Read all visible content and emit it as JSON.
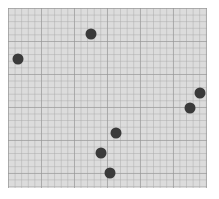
{
  "chart_data": {
    "type": "scatter",
    "title": "",
    "xlabel": "",
    "ylabel": "",
    "grid": true,
    "legend": null,
    "plot_area_px": {
      "left": 8,
      "top": 8,
      "width": 199,
      "height": 180
    },
    "point_color": "#3a3a3a",
    "background_color": "#dcdcdc",
    "points_px": [
      {
        "x": 91,
        "y": 34
      },
      {
        "x": 18,
        "y": 59
      },
      {
        "x": 200,
        "y": 93
      },
      {
        "x": 190,
        "y": 108
      },
      {
        "x": 116,
        "y": 133
      },
      {
        "x": 101,
        "y": 153
      },
      {
        "x": 110,
        "y": 173
      }
    ]
  }
}
